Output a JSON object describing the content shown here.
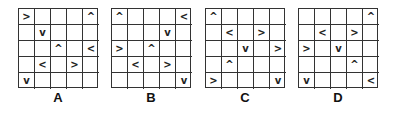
{
  "options": [
    {
      "label": "A",
      "grid": [
        [
          ">",
          "",
          "",
          "",
          "^"
        ],
        [
          "",
          "v",
          "",
          "",
          ""
        ],
        [
          "",
          "",
          "^",
          "",
          "<"
        ],
        [
          "",
          "<",
          "",
          ">",
          ""
        ],
        [
          "v",
          "",
          "",
          "",
          ""
        ]
      ]
    },
    {
      "label": "B",
      "grid": [
        [
          "^",
          "",
          "",
          "",
          "<"
        ],
        [
          "",
          "",
          "",
          "v",
          ""
        ],
        [
          ">",
          "",
          "^",
          "",
          ""
        ],
        [
          "",
          "<",
          "",
          ">",
          ""
        ],
        [
          "",
          "",
          "",
          "",
          "v"
        ]
      ]
    },
    {
      "label": "C",
      "grid": [
        [
          "^",
          "",
          "",
          "",
          ""
        ],
        [
          "",
          "<",
          "",
          ">",
          ""
        ],
        [
          "",
          "",
          "v",
          "",
          ">"
        ],
        [
          "",
          "^",
          "",
          "",
          ""
        ],
        [
          ">",
          "",
          "",
          "",
          "v"
        ]
      ]
    },
    {
      "label": "D",
      "grid": [
        [
          "",
          "",
          "",
          "",
          "^"
        ],
        [
          "",
          "<",
          "",
          ">",
          ""
        ],
        [
          ">",
          "",
          "v",
          "",
          ""
        ],
        [
          "",
          "",
          "",
          "^",
          ""
        ],
        [
          "v",
          "",
          "",
          "",
          "<"
        ]
      ]
    }
  ]
}
